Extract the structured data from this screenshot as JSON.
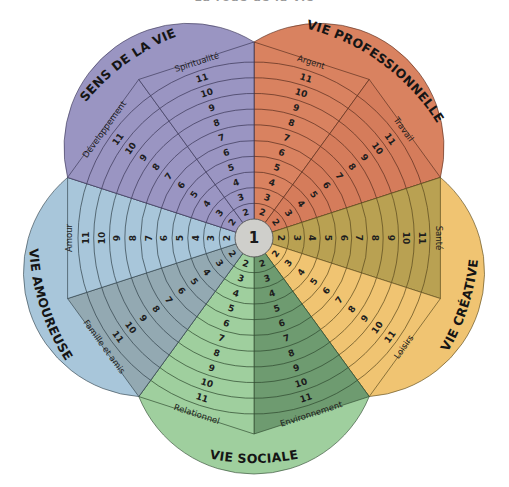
{
  "title": "La roue de la vie",
  "hub": {
    "label": "1",
    "color": "#cfcfcb"
  },
  "rings": [
    "2",
    "3",
    "4",
    "5",
    "6",
    "7",
    "8",
    "9",
    "10",
    "11"
  ],
  "petals": [
    {
      "name": "VIE PROFESSIONNELLE",
      "sectors": [
        {
          "label": "Argent",
          "color": "#d98260"
        },
        {
          "label": "Travail",
          "color": "#d57c5b"
        }
      ],
      "stroke": "#5a2f20"
    },
    {
      "name": "VIE CRÉATIVE",
      "sectors": [
        {
          "label": "Santé",
          "color": "#b9a152"
        },
        {
          "label": "Loisirs",
          "color": "#f0c472"
        }
      ],
      "outer_color": "#f0c472",
      "stroke": "#5a4a1e"
    },
    {
      "name": "VIE SOCIALE",
      "sectors": [
        {
          "label": "Environnement",
          "color": "#6e9b70"
        },
        {
          "label": "Relationnel",
          "color": "#9fcf9e"
        }
      ],
      "outer_color": "#9fcf9e",
      "stroke": "#2f4a30"
    },
    {
      "name": "VIE AMOUREUSE",
      "sectors": [
        {
          "label": "Famille et amis",
          "color": "#93a9b2"
        },
        {
          "label": "Amour",
          "color": "#a8c6da"
        }
      ],
      "outer_color": "#a8c6da",
      "stroke": "#34444c"
    },
    {
      "name": "SENS DE LA VIE",
      "sectors": [
        {
          "label": "Développement",
          "color": "#9a95c2"
        },
        {
          "label": "Spiritualité",
          "color": "#9a95c2"
        }
      ],
      "stroke": "#3c3858"
    }
  ]
}
